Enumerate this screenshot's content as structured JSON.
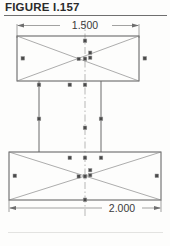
{
  "figure": {
    "caption": "FIGURE I.157"
  },
  "dimensions": {
    "top": {
      "label": "1.500",
      "member": "upper-beam-width"
    },
    "bottom": {
      "label": "2.000",
      "member": "lower-beam-width"
    }
  },
  "colors": {
    "paper": "#fdfdfc",
    "caption_text": "#2b2b2b",
    "caption_rule": "#6f6f6f",
    "outline": "#5a5a5a",
    "brace": "#8a8a8a",
    "dimension": "#7a7a7a",
    "centerline": "#9a9a9a",
    "node": "#4a4a4a",
    "node_edge": "#9c9c9c"
  },
  "structure": {
    "type": "frame-elevation",
    "description": "Two horizontal rectangular members joined by two vertical columns, each rectangle cross-braced with diagonals, symmetric about a vertical centerline.",
    "members": [
      {
        "name": "upper-beam",
        "kind": "rectangle",
        "x": 17,
        "y": 36,
        "width": 122,
        "height": 45,
        "bracing": "x-diagonals"
      },
      {
        "name": "lower-beam",
        "kind": "rectangle",
        "x": 9,
        "y": 152,
        "width": 152,
        "height": 48,
        "bracing": "x-diagonals"
      },
      {
        "name": "left-column",
        "kind": "vertical-line",
        "x": 39,
        "y_top": 81,
        "y_bottom": 152
      },
      {
        "name": "right-column",
        "kind": "vertical-line",
        "x": 101,
        "y_top": 81,
        "y_bottom": 152
      },
      {
        "name": "centerline",
        "kind": "dash-dot-vertical",
        "x": 85,
        "y_top": 20,
        "y_bottom": 216
      }
    ],
    "nodes": [
      {
        "name": "upper-beam-left-mid",
        "x": 23,
        "y": 59
      },
      {
        "name": "upper-beam-right-mid",
        "x": 145,
        "y": 59
      },
      {
        "name": "upper-beam-top-center",
        "x": 85,
        "y": 40
      },
      {
        "name": "upper-beam-center",
        "x": 85,
        "y": 59
      },
      {
        "name": "upper-beam-center-left",
        "x": 79,
        "y": 59
      },
      {
        "name": "upper-beam-center-right",
        "x": 91,
        "y": 56
      },
      {
        "name": "upper-beam-bottom-left",
        "x": 39,
        "y": 84
      },
      {
        "name": "upper-beam-bottom-mid",
        "x": 70,
        "y": 84
      },
      {
        "name": "upper-beam-bottom-ctr",
        "x": 85,
        "y": 84
      },
      {
        "name": "left-column-mid",
        "x": 39,
        "y": 118
      },
      {
        "name": "right-column-mid",
        "x": 101,
        "y": 118
      },
      {
        "name": "centerline-mid",
        "x": 85,
        "y": 125
      },
      {
        "name": "lower-beam-top-mid",
        "x": 70,
        "y": 157
      },
      {
        "name": "lower-beam-top-ctr",
        "x": 85,
        "y": 157
      },
      {
        "name": "lower-beam-top-right",
        "x": 101,
        "y": 157
      },
      {
        "name": "lower-beam-left-mid",
        "x": 15,
        "y": 176
      },
      {
        "name": "lower-beam-right-mid",
        "x": 155,
        "y": 176
      },
      {
        "name": "lower-beam-center",
        "x": 85,
        "y": 176
      },
      {
        "name": "lower-beam-center-left",
        "x": 79,
        "y": 176
      },
      {
        "name": "lower-beam-center-right",
        "x": 91,
        "y": 173
      },
      {
        "name": "lower-beam-bottom-ctr",
        "x": 85,
        "y": 201
      }
    ]
  }
}
